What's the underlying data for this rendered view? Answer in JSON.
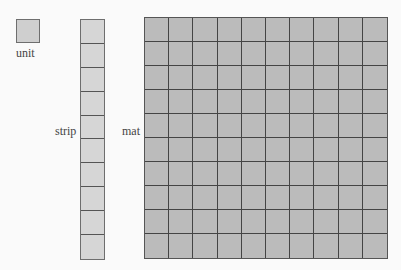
{
  "diagram": {
    "unit": {
      "label": "unit"
    },
    "strip": {
      "label": "strip",
      "cells": 10
    },
    "mat": {
      "label": "mat",
      "rows": 10,
      "cols": 10
    },
    "colors": {
      "unit_fill": "#cfcfcf",
      "strip_fill": "#d6d6d6",
      "mat_fill": "#bbbbbb",
      "stroke": "#555555"
    }
  }
}
